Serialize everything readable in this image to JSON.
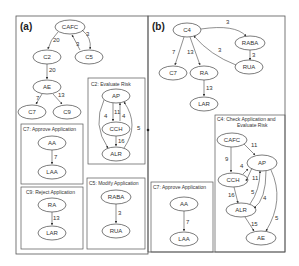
{
  "panels": {
    "a": {
      "label": "(a)",
      "nodes": {
        "CAFC": "CAFC",
        "C2": "C2",
        "C5": "C5",
        "AE": "AE",
        "C7": "C7",
        "C9": "C9"
      },
      "edges": {
        "cafc_c2": "20",
        "c5_cafc": "3",
        "cafc_c5": "3",
        "c2_ae": "20",
        "ae_c7": "7",
        "ae_c9": "13"
      },
      "boxes": {
        "c2": {
          "title": "C2: Evaluate Risk",
          "nodes": {
            "AP": "AP",
            "CCH": "CCH",
            "ALR": "ALR"
          },
          "edges": {
            "ap_cch": "11",
            "cch_ap": "4",
            "ap_alr_left": "4",
            "alr_ap_right": "5",
            "cch_alr": "16"
          }
        },
        "c7": {
          "title": "C7: Approve Application",
          "nodes": {
            "AA": "AA",
            "LAA": "LAA"
          },
          "edges": {
            "aa_laa": "7"
          }
        },
        "c9": {
          "title": "C9: Reject Application",
          "nodes": {
            "RA": "RA",
            "LAR": "LAR"
          },
          "edges": {
            "ra_lar": "13"
          }
        },
        "c5": {
          "title": "C5: Modify Application",
          "nodes": {
            "RABA": "RABA",
            "RUA": "RUA"
          },
          "edges": {
            "raba_rua": "3"
          }
        }
      }
    },
    "b": {
      "label": "(b)",
      "nodes": {
        "C4": "C4",
        "RABA": "RABA",
        "RUA": "RUA",
        "C7": "C7",
        "RA": "RA",
        "LAR": "LAR"
      },
      "edges": {
        "c4_raba": "3",
        "raba_rua": "3",
        "rua_c4": "3",
        "c4_c7": "7",
        "c4_ra": "13",
        "ra_lar": "13"
      },
      "boxes": {
        "c4": {
          "title_line1": "C4: Check Application and",
          "title_line2": "Evaluate Risk",
          "nodes": {
            "CAFC": "CAFC",
            "AP": "AP",
            "CCH": "CCH",
            "ALR": "ALR",
            "AE": "AE"
          },
          "edges": {
            "cafc_ap": "11",
            "cafc_cch": "9",
            "cch_ap": "4",
            "ap_cch": "11",
            "cch_alr": "16",
            "alr_ap": "5",
            "ap_alr": "4",
            "ap_ae": "5",
            "alr_ae": "15"
          }
        },
        "c7": {
          "title": "C7: Approve Application",
          "nodes": {
            "AA": "AA",
            "LAA": "LAA"
          },
          "edges": {
            "aa_laa": "7"
          }
        }
      }
    }
  }
}
